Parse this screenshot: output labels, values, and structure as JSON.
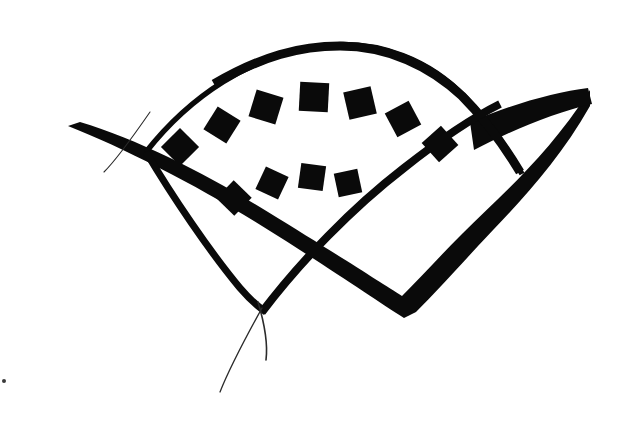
{
  "artwork": {
    "title": "Fan Brush Mark",
    "medium": "brush-ink-logo",
    "background_color": "#ffffff",
    "ink_color": "#0a0a0a",
    "hairline_color": "#2b2b2b",
    "canvas": {
      "width": 627,
      "height": 422
    },
    "description": "Black brush-ink calligraphic mark: a fan / shell silhouette formed by an upper arc and a lower arc that cross near the bottom, enclosing two concentric rows of small rotated squares, with a thick tapered diagonal brush stroke sweeping across from lower-left to upper-right."
  },
  "elements": {
    "upper_arc": {
      "name": "upper-arc",
      "path": "M 146 152 C 190 96 250 56 320 46 C 380 38 432 62 466 98 C 492 126 512 156 520 172",
      "stroke_width_start": 4.5,
      "stroke_width_peak": 9,
      "apex": [
        338,
        47
      ],
      "start_point": [
        146,
        152
      ],
      "end_point": [
        520,
        172
      ]
    },
    "lower_arc": {
      "name": "lower-arc",
      "path": "M 262 312 C 300 262 352 208 404 168 C 442 138 472 118 500 104",
      "stroke_width": 8,
      "start_point": [
        262,
        312
      ],
      "end_point": [
        500,
        104
      ]
    },
    "left_descender": {
      "name": "left-descender-arc",
      "path": "M 146 152 C 172 196 210 252 240 288 C 252 302 260 308 266 312",
      "stroke_width": 7
    },
    "tail_left": {
      "name": "tail-hairline-left",
      "path": "M 262 308 C 250 330 232 362 220 392",
      "stroke_width": 1.3
    },
    "tail_right": {
      "name": "tail-hairline-right",
      "path": "M 258 302 C 264 322 268 344 266 360",
      "stroke_width": 1.6
    },
    "diagonal_stroke": {
      "name": "diagonal-brush-stroke",
      "description": "Thick tapered brush stroke from blunt tip at lower-left rising to the right, widest mid-span, ending in a broad wedge at upper-right.",
      "tip_left": [
        68,
        126
      ],
      "tip_right": [
        590,
        90
      ],
      "max_width": 18
    },
    "diagonal_hairline": {
      "name": "diagonal-hairline-whisker",
      "path": "M 150 112 C 132 138 118 158 104 172",
      "stroke_width": 1.1
    },
    "outer_squares": {
      "name": "outer-square-arc",
      "count": 7,
      "squares": [
        {
          "cx": 180,
          "cy": 147,
          "size": 27,
          "rotation": 45
        },
        {
          "cx": 222,
          "cy": 125,
          "size": 27,
          "rotation": 32
        },
        {
          "cx": 266,
          "cy": 107,
          "size": 28,
          "rotation": 17
        },
        {
          "cx": 314,
          "cy": 97,
          "size": 29,
          "rotation": 3
        },
        {
          "cx": 360,
          "cy": 103,
          "size": 28,
          "rotation": -13
        },
        {
          "cx": 403,
          "cy": 119,
          "size": 27,
          "rotation": -28
        },
        {
          "cx": 440,
          "cy": 144,
          "size": 26,
          "rotation": -42
        }
      ]
    },
    "inner_squares": {
      "name": "inner-square-arc",
      "count": 4,
      "squares": [
        {
          "cx": 234,
          "cy": 198,
          "size": 25,
          "rotation": 44
        },
        {
          "cx": 272,
          "cy": 183,
          "size": 25,
          "rotation": 25
        },
        {
          "cx": 312,
          "cy": 177,
          "size": 25,
          "rotation": 8
        },
        {
          "cx": 348,
          "cy": 183,
          "size": 24,
          "rotation": -12
        }
      ]
    },
    "speck": {
      "name": "stray-ink-speck",
      "cx": 4,
      "cy": 381,
      "r": 2
    }
  }
}
